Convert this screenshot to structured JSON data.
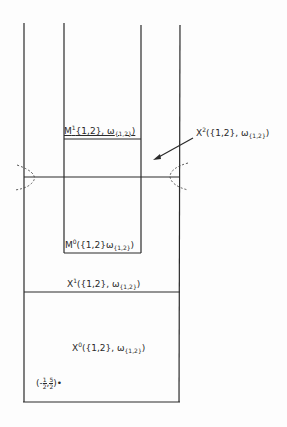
{
  "labels": {
    "m1": {
      "base": "M",
      "sup": "1",
      "body": "{1,2}, ω",
      "sub": "{1,2}",
      "close": ")"
    },
    "m0": {
      "base": "M",
      "sup": "0",
      "body": "({1,2}",
      "omega": "ω",
      "sub": "{1,2}",
      "close": ")"
    },
    "x2": {
      "base": "X",
      "sup": "2",
      "body": "({1,2}, ω",
      "sub": "{1,2}",
      "close": ")"
    },
    "x1": {
      "base": "X",
      "sup": "1",
      "body": "({1,2}, ω",
      "sub": "{1,2}",
      "close": ")"
    },
    "x0": {
      "base": "X",
      "sup": "0",
      "body": "({1,2}, ω",
      "sub": "{1,2}",
      "close": ")"
    },
    "point": {
      "open": "(-",
      "num1": "1",
      "den1": "2",
      "sep": ",",
      "num2": "5",
      "den2": "2",
      "close": ")•"
    }
  },
  "colors": {
    "line": "#2a2a2a",
    "background": "#fdfdfd"
  }
}
